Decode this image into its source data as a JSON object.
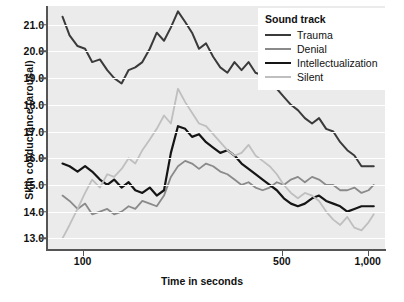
{
  "chart_data": {
    "type": "line",
    "title": "",
    "xlabel": "Time in seconds",
    "ylabel": "Skin conductance (arousal)",
    "xscale": "log",
    "xlim": [
      75,
      1150
    ],
    "ylim": [
      12.6,
      21.7
    ],
    "xticks": [
      100,
      500,
      1000
    ],
    "xticklabels": [
      "100",
      "500",
      "1,000"
    ],
    "yticks": [
      13.0,
      14.0,
      15.0,
      16.0,
      17.0,
      18.0,
      19.0,
      20.0,
      21.0
    ],
    "yticklabels": [
      "13.0",
      "14.0",
      "15.0",
      "16.0",
      "17.0",
      "18.0",
      "19.0",
      "20.0",
      "21.0"
    ],
    "grid": "horizontal",
    "legend_position": "top-right",
    "legend_title": "Sound track",
    "series": [
      {
        "name": "Trauma",
        "color": "#3a3a3a",
        "x": [
          85,
          90,
          96,
          102,
          108,
          115,
          122,
          129,
          137,
          145,
          153,
          162,
          172,
          182,
          193,
          204,
          216,
          229,
          242,
          256,
          271,
          287,
          304,
          322,
          341,
          361,
          382,
          404,
          428,
          453,
          480,
          508,
          538,
          569,
          602,
          638,
          675,
          715,
          757,
          801,
          848,
          898,
          951,
          1007,
          1050
        ],
        "y": [
          21.3,
          20.6,
          20.2,
          20.1,
          19.6,
          19.7,
          19.3,
          19.0,
          18.8,
          19.3,
          19.4,
          19.6,
          20.1,
          20.7,
          20.4,
          20.9,
          21.5,
          21.1,
          20.7,
          20.1,
          20.3,
          19.8,
          19.4,
          19.2,
          19.6,
          19.3,
          19.6,
          19.2,
          19.1,
          19.0,
          18.6,
          18.3,
          18.0,
          17.8,
          17.5,
          17.3,
          17.5,
          17.1,
          17.0,
          16.6,
          16.3,
          16.1,
          15.7,
          15.7,
          15.7
        ]
      },
      {
        "name": "Denial",
        "color": "#8a8a8a",
        "x": [
          85,
          90,
          96,
          102,
          108,
          115,
          122,
          129,
          137,
          145,
          153,
          162,
          172,
          182,
          193,
          204,
          216,
          229,
          242,
          256,
          271,
          287,
          304,
          322,
          341,
          361,
          382,
          404,
          428,
          453,
          480,
          508,
          538,
          569,
          602,
          638,
          675,
          715,
          757,
          801,
          848,
          898,
          951,
          1007,
          1050
        ],
        "y": [
          14.6,
          14.4,
          14.1,
          14.3,
          13.9,
          14.0,
          14.1,
          13.9,
          14.0,
          14.2,
          14.1,
          14.4,
          14.3,
          14.2,
          14.6,
          15.3,
          15.7,
          15.9,
          15.8,
          15.6,
          15.8,
          15.7,
          15.5,
          15.4,
          15.2,
          15.0,
          15.1,
          14.9,
          14.8,
          14.9,
          15.1,
          15.0,
          15.2,
          15.3,
          15.1,
          15.3,
          15.2,
          15.0,
          15.0,
          14.8,
          14.8,
          14.9,
          14.7,
          14.8,
          15.0
        ]
      },
      {
        "name": "Intellectualization",
        "color": "#151515",
        "x": [
          85,
          90,
          96,
          102,
          108,
          115,
          122,
          129,
          137,
          145,
          153,
          162,
          172,
          182,
          193,
          204,
          216,
          229,
          242,
          256,
          271,
          287,
          304,
          322,
          341,
          361,
          382,
          404,
          428,
          453,
          480,
          508,
          538,
          569,
          602,
          638,
          675,
          715,
          757,
          801,
          848,
          898,
          951,
          1007,
          1050
        ],
        "y": [
          15.8,
          15.7,
          15.5,
          15.7,
          15.5,
          15.2,
          15.0,
          15.2,
          14.9,
          15.1,
          14.8,
          14.7,
          14.9,
          14.6,
          14.8,
          16.2,
          17.2,
          17.1,
          16.8,
          16.9,
          16.6,
          16.4,
          16.2,
          16.3,
          16.1,
          15.8,
          15.6,
          15.4,
          15.2,
          15.0,
          14.8,
          14.5,
          14.3,
          14.2,
          14.3,
          14.5,
          14.6,
          14.4,
          14.3,
          14.2,
          14.0,
          14.1,
          14.2,
          14.2,
          14.2
        ]
      },
      {
        "name": "Silent",
        "color": "#bfbfbf",
        "x": [
          85,
          90,
          96,
          102,
          108,
          115,
          122,
          129,
          137,
          145,
          153,
          162,
          172,
          182,
          193,
          204,
          216,
          229,
          242,
          256,
          271,
          287,
          304,
          322,
          341,
          361,
          382,
          404,
          428,
          453,
          480,
          508,
          538,
          569,
          602,
          638,
          675,
          715,
          757,
          801,
          848,
          898,
          951,
          1007,
          1050
        ],
        "y": [
          13.0,
          13.5,
          14.1,
          14.7,
          15.2,
          14.9,
          15.4,
          15.3,
          15.6,
          16.0,
          15.8,
          16.3,
          16.7,
          17.1,
          17.6,
          17.3,
          18.6,
          18.1,
          17.7,
          17.3,
          17.2,
          16.9,
          16.6,
          16.3,
          16.1,
          16.2,
          16.5,
          16.1,
          15.9,
          15.7,
          15.4,
          15.0,
          14.7,
          14.5,
          14.7,
          14.6,
          14.4,
          14.0,
          13.7,
          13.5,
          13.8,
          13.4,
          13.3,
          13.6,
          13.9
        ]
      }
    ]
  },
  "legend": {
    "title": "Sound track",
    "items": [
      {
        "label": "Trauma",
        "color": "#3a3a3a",
        "width": "2.2px"
      },
      {
        "label": "Denial",
        "color": "#8a8a8a",
        "width": "2.0px"
      },
      {
        "label": "Intellectualization",
        "color": "#151515",
        "width": "2.4px"
      },
      {
        "label": "Silent",
        "color": "#bfbfbf",
        "width": "2.0px"
      }
    ]
  },
  "axes": {
    "x_title": "Time in seconds",
    "y_title": "Skin conductance (arousal)"
  }
}
